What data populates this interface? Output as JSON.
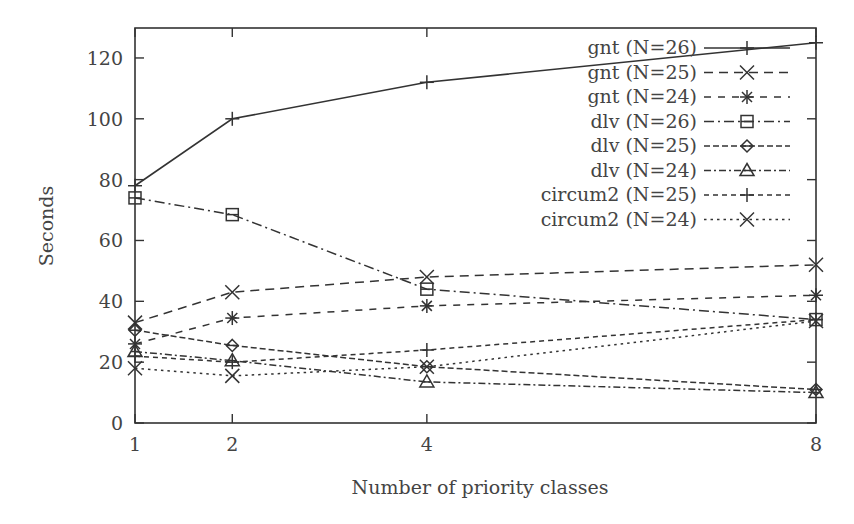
{
  "chart_data": {
    "type": "line",
    "title": "",
    "xlabel": "Number of priority classes",
    "ylabel": "Seconds",
    "x": [
      1,
      2,
      4,
      8
    ],
    "xticks": [
      1,
      2,
      4,
      8
    ],
    "yticks": [
      0,
      20,
      40,
      60,
      80,
      100,
      120
    ],
    "xlim": [
      1,
      8
    ],
    "ylim": [
      0,
      130
    ],
    "grid": false,
    "legend_position": "top-right-inside",
    "series": [
      {
        "name": "gnt (N=26)",
        "marker": "plus",
        "dash": "solid",
        "values": [
          78,
          100,
          112,
          125
        ]
      },
      {
        "name": "gnt (N=25)",
        "marker": "x",
        "dash": "dashed",
        "values": [
          33,
          43,
          48,
          52
        ]
      },
      {
        "name": "gnt (N=24)",
        "marker": "star",
        "dash": "dashed-sparse",
        "values": [
          26,
          34.5,
          38.5,
          42
        ]
      },
      {
        "name": "dlv (N=26)",
        "marker": "square",
        "dash": "dash-dot",
        "values": [
          74,
          68.5,
          44,
          34
        ]
      },
      {
        "name": "dlv (N=25)",
        "marker": "diamond",
        "dash": "dashed-dense",
        "values": [
          30.5,
          25.5,
          18.5,
          11
        ]
      },
      {
        "name": "dlv (N=24)",
        "marker": "triangle",
        "dash": "dash-dot-dense",
        "values": [
          23.5,
          20.5,
          13.5,
          10
        ]
      },
      {
        "name": "circum2 (N=25)",
        "marker": "plus",
        "dash": "dashed-short",
        "values": [
          22,
          20,
          24,
          34
        ]
      },
      {
        "name": "circum2 (N=24)",
        "marker": "x",
        "dash": "dotted",
        "values": [
          18,
          15.5,
          18.5,
          33.5
        ]
      }
    ]
  },
  "axes": {
    "xlabel": "Number of priority classes",
    "ylabel": "Seconds",
    "xtick_labels": [
      "1",
      "2",
      "4",
      "8"
    ],
    "ytick_labels": [
      "0",
      "20",
      "40",
      "60",
      "80",
      "100",
      "120"
    ]
  },
  "legend": {
    "items": [
      "gnt (N=26)",
      "gnt (N=25)",
      "gnt (N=24)",
      "dlv (N=26)",
      "dlv (N=25)",
      "dlv (N=24)",
      "circum2 (N=25)",
      "circum2 (N=24)"
    ]
  },
  "colors": {
    "line": "#333333",
    "axis": "#333333",
    "background": "#ffffff"
  }
}
